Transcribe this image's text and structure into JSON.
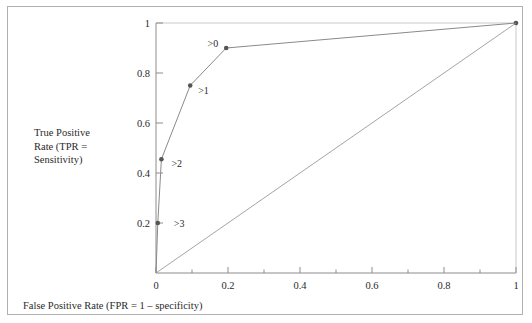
{
  "figure": {
    "background": "#ffffff",
    "frame_color": "#b0b0b0",
    "axis_color": "#8c8c8c",
    "curve_color": "#8a8a8a",
    "marker_color": "#555555",
    "text_color": "#2a2a2a"
  },
  "labels": {
    "ylabel": "True Positive\nRate (TPR =\nSensitivity)",
    "xlabel": "False Positive Rate (FPR = 1 – specificity)"
  },
  "chart_data": {
    "type": "line",
    "title": "",
    "xlabel": "False Positive Rate (FPR = 1 – specificity)",
    "ylabel": "True Positive Rate (TPR = Sensitivity)",
    "xlim": [
      0,
      1
    ],
    "ylim": [
      0,
      1
    ],
    "grid": false,
    "legend": "none",
    "xticks": [
      0,
      0.2,
      0.4,
      0.6,
      0.8,
      1
    ],
    "xticklabels": [
      "0",
      "0.2",
      "0.4",
      "0.6",
      "0.8",
      "1"
    ],
    "xminorticks": [
      0.1,
      0.3,
      0.5,
      0.7,
      0.9
    ],
    "yticks": [
      0.2,
      0.4,
      0.6,
      0.8,
      1
    ],
    "yticklabels": [
      "0.2",
      "0.4",
      "0.6",
      "0.8",
      "1"
    ],
    "series": [
      {
        "name": "ROC curve",
        "type": "line",
        "x": [
          0,
          0.005,
          0.015,
          0.095,
          0.195,
          1
        ],
        "y": [
          0,
          0.2,
          0.455,
          0.75,
          0.9,
          1
        ],
        "marker_x": [
          0.005,
          0.015,
          0.095,
          0.195,
          1
        ],
        "marker_y": [
          0.2,
          0.455,
          0.75,
          0.9,
          1
        ],
        "color": "#8a8a8a"
      },
      {
        "name": "chance diagonal",
        "type": "line",
        "x": [
          0,
          1
        ],
        "y": [
          0,
          1
        ],
        "color": "#9a9a9a"
      }
    ],
    "annotations": [
      {
        "text": ">3",
        "x": 0.005,
        "y": 0.2,
        "anchor": "right",
        "dx": 16,
        "dy": 3.5
      },
      {
        "text": ">2",
        "x": 0.015,
        "y": 0.455,
        "anchor": "right",
        "dx": 10,
        "dy": 8
      },
      {
        "text": ">1",
        "x": 0.095,
        "y": 0.75,
        "anchor": "right",
        "dx": 8,
        "dy": 8
      },
      {
        "text": ">0",
        "x": 0.195,
        "y": 0.9,
        "anchor": "left",
        "dx": -8,
        "dy": -1
      }
    ]
  }
}
